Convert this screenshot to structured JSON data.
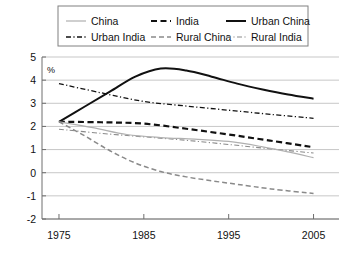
{
  "legend": {
    "position": "top",
    "entries": [
      {
        "label": "China",
        "key": "china",
        "color": "#b0b0b0",
        "style": "solid",
        "width": 1.2
      },
      {
        "label": "India",
        "key": "india",
        "color": "#111111",
        "style": "dashed",
        "width": 2.2
      },
      {
        "label": "Urban China",
        "key": "urban_china",
        "color": "#111111",
        "style": "solid",
        "width": 2.0
      },
      {
        "label": "Urban India",
        "key": "urban_india",
        "color": "#111111",
        "style": "dashdot",
        "width": 1.3
      },
      {
        "label": "Rural China",
        "key": "rural_china",
        "color": "#8a8a8a",
        "style": "dashed",
        "width": 1.5
      },
      {
        "label": "Rural India",
        "key": "rural_india",
        "color": "#8a8a8a",
        "style": "dashdot",
        "width": 1.1
      }
    ]
  },
  "chart_data": {
    "type": "line",
    "title": "",
    "xlabel": "",
    "ylabel": "%",
    "xlim": [
      1973,
      2008
    ],
    "ylim": [
      -2,
      5
    ],
    "yticks": [
      -2,
      -1,
      0,
      1,
      2,
      3,
      4,
      5
    ],
    "ytick_labels": [
      "-2",
      "-1",
      "0",
      "1",
      "2",
      "3",
      "4",
      "5"
    ],
    "xticks": [
      1975,
      1985,
      1995,
      2005
    ],
    "xtick_labels": [
      "1975",
      "1985",
      "1995",
      "2005"
    ],
    "grid": "horizontal",
    "series": [
      {
        "name": "Urban China",
        "key": "urban_china",
        "color": "#111111",
        "style": "solid",
        "width": 2.0,
        "x": [
          1975,
          1978,
          1981,
          1984,
          1987,
          1990,
          1993,
          1996,
          1999,
          2002,
          2005
        ],
        "values": [
          2.2,
          2.85,
          3.5,
          4.15,
          4.5,
          4.42,
          4.15,
          3.85,
          3.6,
          3.38,
          3.2
        ]
      },
      {
        "name": "Urban India",
        "key": "urban_india",
        "color": "#111111",
        "style": "dashdot",
        "width": 1.3,
        "x": [
          1975,
          1980,
          1985,
          1990,
          1995,
          2000,
          2005
        ],
        "values": [
          3.85,
          3.45,
          3.08,
          2.88,
          2.7,
          2.52,
          2.35
        ]
      },
      {
        "name": "India",
        "key": "india",
        "color": "#111111",
        "style": "dashed",
        "width": 2.2,
        "x": [
          1975,
          1980,
          1985,
          1990,
          1995,
          2000,
          2005
        ],
        "values": [
          2.2,
          2.18,
          2.12,
          1.9,
          1.65,
          1.38,
          1.1
        ]
      },
      {
        "name": "Rural India",
        "key": "rural_india",
        "color": "#8a8a8a",
        "style": "dashdot",
        "width": 1.1,
        "x": [
          1975,
          1980,
          1985,
          1990,
          1995,
          2000,
          2005
        ],
        "values": [
          1.88,
          1.7,
          1.55,
          1.4,
          1.22,
          1.03,
          0.85
        ]
      },
      {
        "name": "China",
        "key": "china",
        "color": "#b0b0b0",
        "style": "solid",
        "width": 1.2,
        "x": [
          1975,
          1979,
          1983,
          1987,
          1991,
          1995,
          1999,
          2002,
          2005
        ],
        "values": [
          2.2,
          1.95,
          1.65,
          1.52,
          1.45,
          1.35,
          1.12,
          0.9,
          0.65
        ]
      },
      {
        "name": "Rural China",
        "key": "rural_china",
        "color": "#8a8a8a",
        "style": "dashed",
        "width": 1.5,
        "x": [
          1975,
          1978,
          1981,
          1984,
          1987,
          1990,
          1993,
          1996,
          2000,
          2005
        ],
        "values": [
          2.2,
          1.6,
          0.95,
          0.42,
          0.05,
          -0.18,
          -0.35,
          -0.5,
          -0.7,
          -0.9
        ]
      }
    ]
  }
}
